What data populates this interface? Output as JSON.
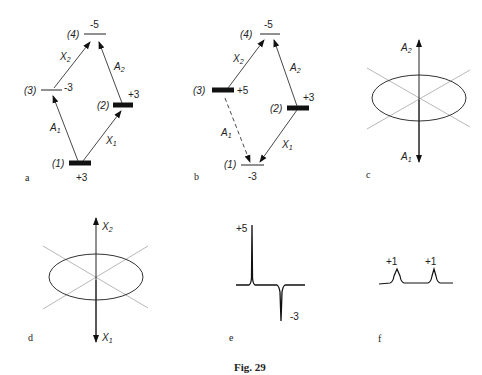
{
  "figure": {
    "caption": "Fig. 29",
    "panels": {
      "a": {
        "label": "a",
        "levels": [
          {
            "id": "(1)",
            "value": "+3",
            "populated": true
          },
          {
            "id": "(2)",
            "value": "+3",
            "populated": true
          },
          {
            "id": "(3)",
            "value": "-3",
            "populated": false
          },
          {
            "id": "(4)",
            "value": "-5",
            "populated": false
          }
        ],
        "transitions": [
          {
            "label": "A",
            "sub": "1",
            "from": "(1)",
            "to": "(3)",
            "style": "solid"
          },
          {
            "label": "X",
            "sub": "1",
            "from": "(1)",
            "to": "(2)",
            "style": "solid"
          },
          {
            "label": "X",
            "sub": "2",
            "from": "(3)",
            "to": "(4)",
            "style": "solid"
          },
          {
            "label": "A",
            "sub": "2",
            "from": "(2)",
            "to": "(4)",
            "style": "solid"
          }
        ]
      },
      "b": {
        "label": "b",
        "levels": [
          {
            "id": "(1)",
            "value": "-3",
            "populated": false
          },
          {
            "id": "(2)",
            "value": "+3",
            "populated": true
          },
          {
            "id": "(3)",
            "value": "+5",
            "populated": true
          },
          {
            "id": "(4)",
            "value": "-5",
            "populated": false
          }
        ],
        "transitions": [
          {
            "label": "A",
            "sub": "1",
            "from": "(3)",
            "to": "(1)",
            "style": "dashed"
          },
          {
            "label": "X",
            "sub": "1",
            "from": "(2)",
            "to": "(1)",
            "style": "solid"
          },
          {
            "label": "X",
            "sub": "2",
            "from": "(3)",
            "to": "(4)",
            "style": "solid"
          },
          {
            "label": "A",
            "sub": "2",
            "from": "(2)",
            "to": "(4)",
            "style": "solid"
          }
        ]
      },
      "c": {
        "label": "c",
        "axis_top": "A",
        "axis_top_sub": "2",
        "axis_bottom": "A",
        "axis_bottom_sub": "1"
      },
      "d": {
        "label": "d",
        "axis_top": "X",
        "axis_top_sub": "2",
        "axis_bottom": "X",
        "axis_bottom_sub": "1"
      },
      "e": {
        "label": "e",
        "peak_up": "+5",
        "peak_down": "-3"
      },
      "f": {
        "label": "f",
        "peak1": "+1",
        "peak2": "+1"
      }
    }
  }
}
